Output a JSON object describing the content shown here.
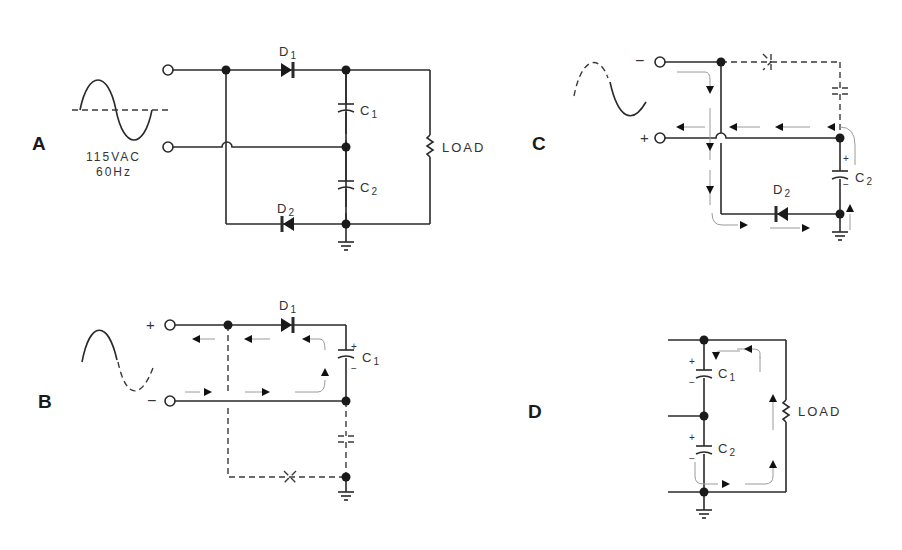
{
  "panels": {
    "A": {
      "label": "A",
      "source_voltage": "115VAC",
      "source_freq": "60Hz",
      "d1": "D",
      "d1_sub": "1",
      "d2": "D",
      "d2_sub": "2",
      "c1": "C",
      "c1_sub": "1",
      "c2": "C",
      "c2_sub": "2",
      "load": "LOAD"
    },
    "B": {
      "label": "B",
      "plus": "+",
      "minus": "−",
      "d1": "D",
      "d1_sub": "1",
      "c1": "C",
      "c1_sub": "1",
      "cap_plus": "+",
      "cap_minus": "−"
    },
    "C": {
      "label": "C",
      "plus": "+",
      "minus": "−",
      "d2": "D",
      "d2_sub": "2",
      "c2": "C",
      "c2_sub": "2",
      "cap_plus": "+",
      "cap_minus": "−"
    },
    "D": {
      "label": "D",
      "c1": "C",
      "c1_sub": "1",
      "c2": "C",
      "c2_sub": "2",
      "load": "LOAD",
      "c1_plus": "+",
      "c1_minus": "−",
      "c2_plus": "+",
      "c2_minus": "−"
    }
  },
  "colors": {
    "line": "#2a2a2a",
    "background": "#ffffff",
    "flow": "#9a9a9a"
  }
}
